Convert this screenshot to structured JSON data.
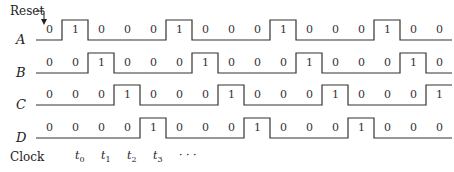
{
  "reset_label": "Reset",
  "clock_label": "Clock",
  "cell_count": 16,
  "signals": [
    {
      "name": "A",
      "bits": [
        0,
        1,
        0,
        0,
        0,
        1,
        0,
        0,
        0,
        1,
        0,
        0,
        0,
        1,
        0,
        0
      ]
    },
    {
      "name": "B",
      "bits": [
        0,
        0,
        1,
        0,
        0,
        0,
        1,
        0,
        0,
        0,
        1,
        0,
        0,
        0,
        1,
        0
      ]
    },
    {
      "name": "C",
      "bits": [
        0,
        0,
        0,
        1,
        0,
        0,
        0,
        1,
        0,
        0,
        0,
        1,
        0,
        0,
        0,
        1
      ]
    },
    {
      "name": "D",
      "bits": [
        0,
        0,
        0,
        0,
        1,
        0,
        0,
        0,
        1,
        0,
        0,
        0,
        1,
        0,
        0,
        0
      ]
    }
  ],
  "clock_ticks": [
    {
      "label": "t",
      "sub": "0"
    },
    {
      "label": "t",
      "sub": "1"
    },
    {
      "label": "t",
      "sub": "2"
    },
    {
      "label": "t",
      "sub": "3"
    },
    {
      "label": "· · ·",
      "sub": ""
    }
  ]
}
